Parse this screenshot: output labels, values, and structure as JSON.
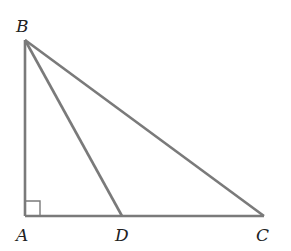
{
  "figure": {
    "type": "right-triangle-with-cevian",
    "stroke_color": "#7a7a7a",
    "label_color": "#222222",
    "points": {
      "A": {
        "label": "A",
        "x": 25,
        "y": 216,
        "label_x": 16,
        "label_y": 241
      },
      "B": {
        "label": "B",
        "x": 25,
        "y": 40,
        "label_x": 16,
        "label_y": 32
      },
      "C": {
        "label": "C",
        "x": 264,
        "y": 216,
        "label_x": 256,
        "label_y": 241
      },
      "D": {
        "label": "D",
        "x": 122,
        "y": 216,
        "label_x": 115,
        "label_y": 241
      }
    },
    "segments": [
      {
        "name": "AB",
        "from": "A",
        "to": "B"
      },
      {
        "name": "AC",
        "from": "A",
        "to": "C"
      },
      {
        "name": "BC",
        "from": "B",
        "to": "C"
      },
      {
        "name": "BD",
        "from": "B",
        "to": "D"
      }
    ],
    "right_angle_marker": {
      "at": "A",
      "size": 15
    }
  }
}
